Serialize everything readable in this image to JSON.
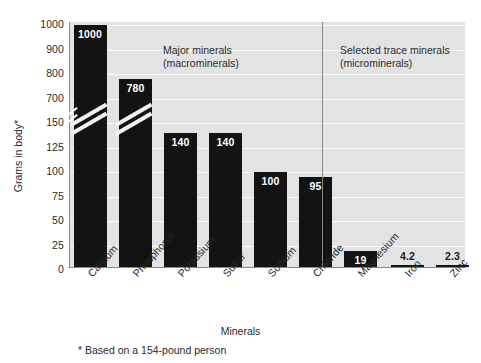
{
  "chart_data": {
    "type": "bar",
    "title": "",
    "xlabel": "Minerals",
    "ylabel": "Grams in body*",
    "categories": [
      "Calcium",
      "Phosphorus",
      "Potassium",
      "Sulfur",
      "Sodium",
      "Chloride",
      "Magnesium",
      "Iron",
      "Zinc",
      "Copper",
      "Iodide"
    ],
    "values": [
      1000,
      780,
      140,
      140,
      100,
      95,
      19,
      4.2,
      2.3,
      0.07,
      0.02
    ],
    "value_labels": [
      "1000",
      "780",
      "140",
      "140",
      "100",
      "95",
      "19",
      "4.2",
      "2.3",
      "0.07",
      "0.02"
    ],
    "yticks_upper": [
      "1000",
      "900",
      "800",
      "700"
    ],
    "yticks_lower": [
      "150",
      "125",
      "100",
      "75",
      "50",
      "25",
      "0"
    ],
    "yticks": [
      "1000",
      "900",
      "800",
      "700",
      "150",
      "125",
      "100",
      "75",
      "50",
      "25",
      "0"
    ],
    "axis_break": true,
    "axis_break_note": "y-axis broken between 150 and 700",
    "ylim_lower": [
      0,
      150
    ],
    "ylim_upper": [
      700,
      1000
    ],
    "grid": true,
    "grid_orientation": "horizontal",
    "legend": "none",
    "groups": [
      {
        "label": "Major minerals\n(macrominerals)",
        "categories": [
          "Calcium",
          "Phosphorus",
          "Potassium",
          "Sulfur",
          "Sodium",
          "Chloride",
          "Magnesium"
        ]
      },
      {
        "label": "Selected trace minerals\n(microminerals)",
        "categories": [
          "Iron",
          "Zinc",
          "Copper",
          "Iodide"
        ]
      }
    ],
    "annotations": [
      {
        "name": "group-label-macro",
        "text": "Major minerals\n(macrominerals)"
      },
      {
        "name": "group-label-micro",
        "text": "Selected trace minerals\n(microminerals)"
      },
      {
        "name": "footnote",
        "text": "* Based on a 154-pound person"
      }
    ],
    "colors": {
      "bar": "#131313",
      "plot_background": "#e3e3e3",
      "gridline": "#fafafa",
      "axis": "#8a8a8a",
      "text": "#2a2a2a",
      "value_label_text": "#ffffff",
      "page_background": "#ffffff"
    }
  },
  "labels": {
    "ylabel": "Grams in body*",
    "xlabel": "Minerals",
    "footnote": "* Based on a 154-pound person",
    "group_macro_line1": "Major minerals",
    "group_macro_line2": "(macrominerals)",
    "group_micro_line1": "Selected trace minerals",
    "group_micro_line2": "(microminerals)"
  }
}
